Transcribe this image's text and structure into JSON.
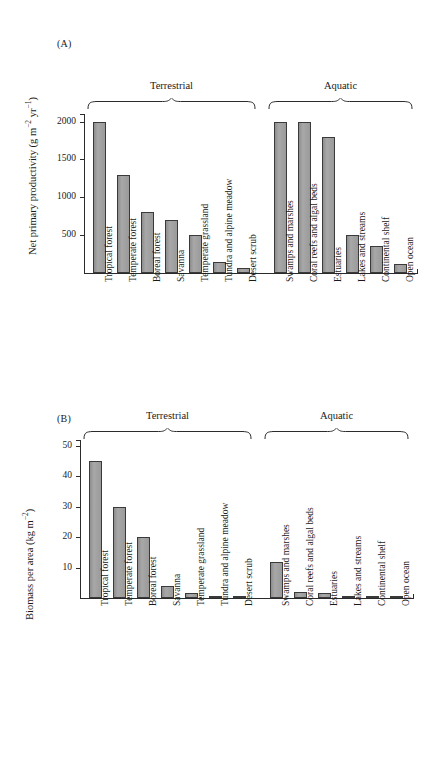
{
  "figure": {
    "panels": [
      {
        "label": "(A)",
        "ylabel_text": "Net primary productivity (g m",
        "ylabel_sup1": "−2",
        "ylabel_mid": " yr",
        "ylabel_sup2": "−1",
        "ylabel_end": ")",
        "groups": [
          {
            "name": "Terrestrial"
          },
          {
            "name": "Aquatic"
          }
        ]
      },
      {
        "label": "(B)",
        "ylabel_text": "Biomass per area (kg m",
        "ylabel_sup1": "−2",
        "ylabel_mid": "",
        "ylabel_sup2": "",
        "ylabel_end": ")",
        "groups": [
          {
            "name": "Terrestrial"
          },
          {
            "name": "Aquatic"
          }
        ]
      }
    ]
  },
  "chart_data": [
    {
      "type": "bar",
      "panel": "(A)",
      "title": "",
      "xlabel": "",
      "ylabel": "Net primary productivity (g m−2 yr−1)",
      "ylim": [
        0,
        2100
      ],
      "yticks": [
        500,
        1000,
        1500,
        2000
      ],
      "ytick_labels": [
        "500",
        "1000",
        "1500",
        "2000"
      ],
      "grid": false,
      "legend": "none",
      "groups": [
        {
          "name": "Terrestrial",
          "categories": [
            "Tropical forest",
            "Temperate forest",
            "Boreal forest",
            "Savanna",
            "Temperate grassland",
            "Tundra and alpine meadow",
            "Desert scrub"
          ]
        },
        {
          "name": "Aquatic",
          "categories": [
            "Swamps and marshes",
            "Coral reefs and algal beds",
            "Estuaries",
            "Lakes and streams",
            "Continental shelf",
            "Open ocean"
          ]
        }
      ],
      "categories": [
        "Tropical forest",
        "Temperate forest",
        "Boreal forest",
        "Savanna",
        "Temperate grassland",
        "Tundra and alpine meadow",
        "Desert scrub",
        "Swamps and marshes",
        "Coral reefs and algal beds",
        "Estuaries",
        "Lakes and streams",
        "Continental shelf",
        "Open ocean"
      ],
      "values": [
        2000,
        1300,
        800,
        700,
        500,
        140,
        70,
        2000,
        2000,
        1800,
        500,
        360,
        125
      ]
    },
    {
      "type": "bar",
      "panel": "(B)",
      "title": "",
      "xlabel": "",
      "ylabel": "Biomass per area (kg m−2)",
      "ylim": [
        0,
        52
      ],
      "yticks": [
        10,
        20,
        30,
        40,
        50
      ],
      "ytick_labels": [
        "10",
        "20",
        "30",
        "40",
        "50"
      ],
      "grid": false,
      "legend": "none",
      "groups": [
        {
          "name": "Terrestrial",
          "categories": [
            "Tropical forest",
            "Temperate forest",
            "Boreal forest",
            "Savanna",
            "Temperate grassland",
            "Tundra and alpine meadow",
            "Desert scrub"
          ]
        },
        {
          "name": "Aquatic",
          "categories": [
            "Swamps and marshes",
            "Coral reefs and algal beds",
            "Estuaries",
            "Lakes and streams",
            "Continental shelf",
            "Open ocean"
          ]
        }
      ],
      "categories": [
        "Tropical forest",
        "Temperate forest",
        "Boreal forest",
        "Savanna",
        "Temperate grassland",
        "Tundra and alpine meadow",
        "Desert scrub",
        "Swamps and marshes",
        "Coral reefs and algal beds",
        "Estuaries",
        "Lakes and streams",
        "Continental shelf",
        "Open ocean"
      ],
      "values": [
        45,
        30,
        20,
        4,
        1.6,
        0.6,
        0.7,
        12,
        2,
        1.5,
        0.3,
        0.15,
        0.08
      ]
    }
  ],
  "style": {
    "bar_fill": "#9d9d9d",
    "bar_stroke": "#3a3a3a",
    "axis_color": "#2b2b2b",
    "text_color": "#1a1a1a",
    "background": "#ffffff"
  }
}
